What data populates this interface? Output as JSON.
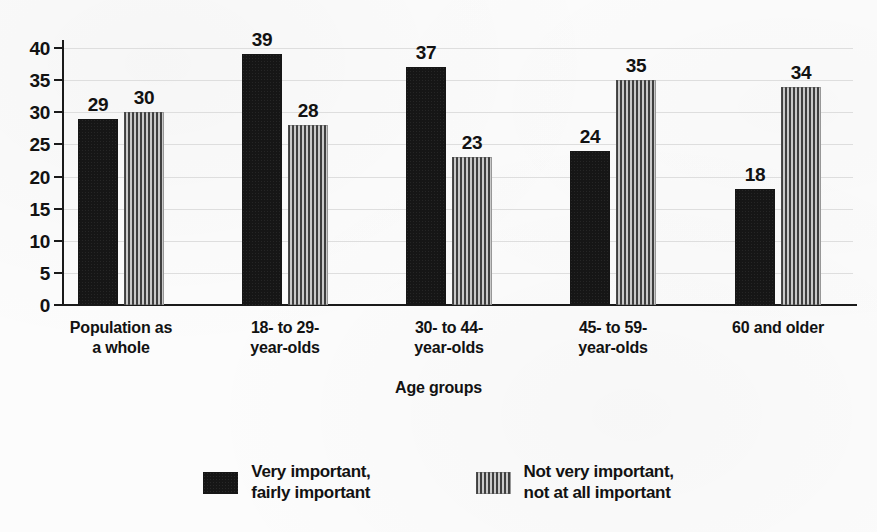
{
  "chart_data": {
    "type": "bar",
    "title": "",
    "xlabel": "Age groups",
    "ylabel": "",
    "categories": [
      "Population as\na whole",
      "18- to 29-\nyear-olds",
      "30- to 44-\nyear-olds",
      "45- to 59-\nyear-olds",
      "60 and older"
    ],
    "series": [
      {
        "name": "Very important,\nfairly important",
        "values": [
          29,
          39,
          37,
          24,
          18
        ],
        "pattern": "solid",
        "color": "#161616"
      },
      {
        "name": "Not very important,\nnot at all important",
        "values": [
          30,
          28,
          23,
          35,
          34
        ],
        "pattern": "vertical-hatch",
        "color": "#3f3f3f"
      }
    ],
    "ylim": [
      0,
      40
    ],
    "yticks": [
      0,
      5,
      10,
      15,
      20,
      25,
      30,
      35,
      40
    ],
    "ytick_labels": [
      "0",
      "5",
      "10",
      "15",
      "20",
      "25",
      "30",
      "35",
      "40"
    ],
    "grid": true,
    "legend_position": "bottom"
  },
  "legend": {
    "items": [
      {
        "label": "Very important,\nfairly important",
        "pattern": "solid"
      },
      {
        "label": "Not very important,\nnot at all important",
        "pattern": "hatch"
      }
    ]
  },
  "colors": {
    "series_1": "#161616",
    "series_2": "#3f3f3f",
    "axis": "#1a1a1a",
    "grid": "#dedede",
    "background": "#fcfcfc",
    "text": "#121212"
  }
}
